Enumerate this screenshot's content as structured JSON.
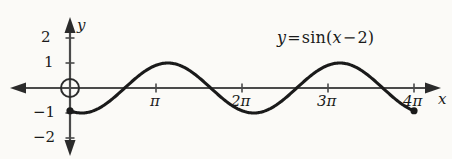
{
  "figure": {
    "background_color": "#fbfaf7",
    "ink_color": "#1a1a1a",
    "axis_color": "#4a4a4a"
  },
  "equation_label": {
    "lhs": "y",
    "equals": "=",
    "fn": "sin",
    "open_paren": "(",
    "arg_var": "x",
    "minus": "−",
    "arg_num": "2",
    "close_paren": ")",
    "full_text": "y = sin (x − 2)"
  },
  "axes": {
    "x_axis_name": "x",
    "y_axis_name": "y",
    "x_ticks": [
      {
        "label": "π",
        "value": 3.14159
      },
      {
        "label": "2π",
        "value": 6.28319
      },
      {
        "label": "3π",
        "value": 9.42478
      },
      {
        "label": "4π",
        "value": 12.56637
      }
    ],
    "y_ticks": [
      {
        "label": "2",
        "value": 2
      },
      {
        "label": "1",
        "value": 1
      },
      {
        "label": "−1",
        "value": -1
      },
      {
        "label": "−2",
        "value": -2
      }
    ]
  },
  "markers": {
    "open_circle_at_origin": {
      "x": 0,
      "y": 0
    },
    "left_endpoint_dot": {
      "x": 0,
      "y": -0.909
    },
    "right_endpoint_dot": {
      "x": 12.56637,
      "y": -0.909
    }
  },
  "chart_data": {
    "type": "line",
    "title": "",
    "subtitle": "",
    "xlabel": "x",
    "ylabel": "y",
    "annotations": [
      "y = sin (x − 2)"
    ],
    "legend": [],
    "legend_position": "none",
    "grid": false,
    "xlim": [
      -1.2,
      13.6
    ],
    "ylim": [
      -2.6,
      2.4
    ],
    "xtick_values": [
      3.14159,
      6.28319,
      9.42478,
      12.56637
    ],
    "xtick_labels": [
      "π",
      "2π",
      "3π",
      "4π"
    ],
    "ytick_values": [
      2,
      1,
      -1,
      -2
    ],
    "ytick_labels": [
      "2",
      "1",
      "−1",
      "−2"
    ],
    "series": [
      {
        "name": "y = sin (x − 2)",
        "formula": "sin(x - 2)",
        "domain": [
          0,
          12.56637
        ],
        "x": [
          0,
          0.628,
          1.257,
          1.885,
          2.513,
          3.142,
          3.77,
          4.398,
          5.027,
          5.655,
          6.283,
          6.912,
          7.54,
          8.168,
          8.796,
          9.425,
          10.053,
          10.681,
          11.31,
          11.938,
          12.566
        ],
        "values": [
          -0.909,
          -0.63,
          -0.175,
          0.344,
          0.77,
          0.997,
          0.959,
          0.676,
          0.234,
          -0.268,
          -0.717,
          -0.982,
          -0.986,
          -0.717,
          -0.268,
          0.234,
          0.676,
          0.959,
          0.997,
          0.77,
          -0.909
        ]
      }
    ],
    "key_points": {
      "first_zero_rising": 2.0,
      "first_max": {
        "x": 3.5708,
        "y": 1
      },
      "second_zero_falling": 5.1416,
      "first_min": {
        "x": 6.7124,
        "y": -1
      },
      "third_zero_rising": 8.2832,
      "second_max": {
        "x": 9.854,
        "y": 1
      },
      "fourth_zero_falling": 11.4248
    }
  }
}
